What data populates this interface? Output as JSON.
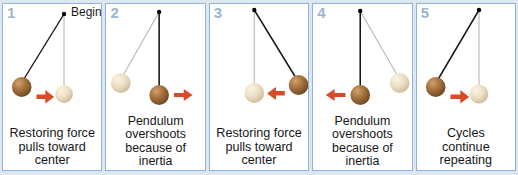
{
  "figure": {
    "frame_color": "#dce7f2",
    "panel_border_color": "#8fb4d9",
    "panel_number_color": "#9db6cf",
    "dark_ball_color": "#9a6b3f",
    "light_ball_color": "#e8dcc0",
    "arrow_color": "#d84a2a",
    "string_color": "#1a1a1a",
    "ghost_string_color": "#b0b0b0"
  },
  "panels": [
    {
      "number": "1",
      "begin_label": "Begin",
      "caption": "Restoring force pulls toward center",
      "caption_lines": [
        "Restoring force",
        "pulls toward",
        "center"
      ],
      "dark_ball": "left",
      "light_ball": "center",
      "arrow_direction": "right"
    },
    {
      "number": "2",
      "begin_label": "",
      "caption": "Pendulum overshoots because of inertia",
      "caption_lines": [
        "Pendulum",
        "overshoots",
        "because of",
        "inertia"
      ],
      "dark_ball": "center",
      "light_ball": "left",
      "arrow_direction": "right"
    },
    {
      "number": "3",
      "begin_label": "",
      "caption": "Restoring force pulls toward center",
      "caption_lines": [
        "Restoring force",
        "pulls toward",
        "center"
      ],
      "dark_ball": "right",
      "light_ball": "center",
      "arrow_direction": "left"
    },
    {
      "number": "4",
      "begin_label": "",
      "caption": "Pendulum overshoots because of inertia",
      "caption_lines": [
        "Pendulum",
        "overshoots",
        "because of",
        "inertia"
      ],
      "dark_ball": "center",
      "light_ball": "right",
      "arrow_direction": "left"
    },
    {
      "number": "5",
      "begin_label": "",
      "caption": "Cycles continue repeating",
      "caption_lines": [
        "Cycles",
        "continue",
        "repeating"
      ],
      "dark_ball": "left",
      "light_ball": "center",
      "arrow_direction": "right"
    }
  ]
}
